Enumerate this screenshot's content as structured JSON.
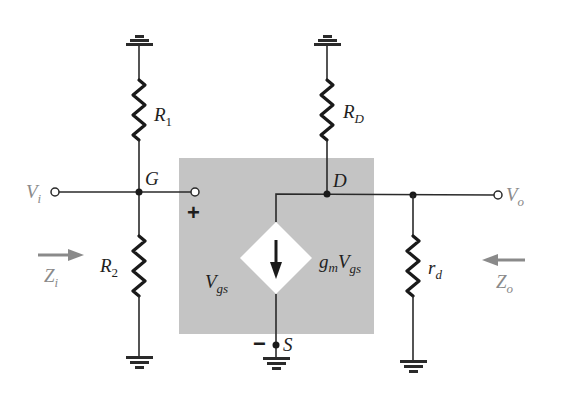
{
  "diagram": {
    "title": "",
    "type": "FET small-signal equivalent circuit (voltage-divider configuration)",
    "colors": {
      "wire": "#2a2a2a",
      "shaded_box": "#c4c4c4",
      "source_diamond": "#ffffff",
      "port_labels": "#8a8a8a",
      "arrows": "#8a8a8a"
    },
    "labels": {
      "vi": {
        "main": "V",
        "sub": "i"
      },
      "vo": {
        "main": "V",
        "sub": "o"
      },
      "zi": {
        "main": "Z",
        "sub": "i"
      },
      "zo": {
        "main": "Z",
        "sub": "o"
      },
      "r1": {
        "main": "R",
        "sub": "1"
      },
      "r2": {
        "main": "R",
        "sub": "2"
      },
      "rd_big": {
        "main": "R",
        "sub": "D"
      },
      "rd_small": {
        "main": "r",
        "sub": "d"
      },
      "gate": "G",
      "drain": "D",
      "source": "S",
      "plus": "+",
      "minus": "−",
      "vgs": {
        "main": "V",
        "sub": "gs"
      },
      "gm_vgs": {
        "g": "g",
        "m": "m",
        "V": "V",
        "gs": "gs"
      }
    },
    "nodes": [
      "Vi",
      "G",
      "D",
      "S",
      "Vo",
      "ground"
    ],
    "components": [
      {
        "name": "R1",
        "between": [
          "G",
          "ground"
        ]
      },
      {
        "name": "R2",
        "between": [
          "G",
          "ground"
        ]
      },
      {
        "name": "RD",
        "between": [
          "D",
          "ground"
        ]
      },
      {
        "name": "rd",
        "between": [
          "D",
          "ground"
        ]
      },
      {
        "name": "gmVgs",
        "type": "dependent current source",
        "between": [
          "D",
          "S"
        ],
        "direction": "down"
      }
    ]
  }
}
